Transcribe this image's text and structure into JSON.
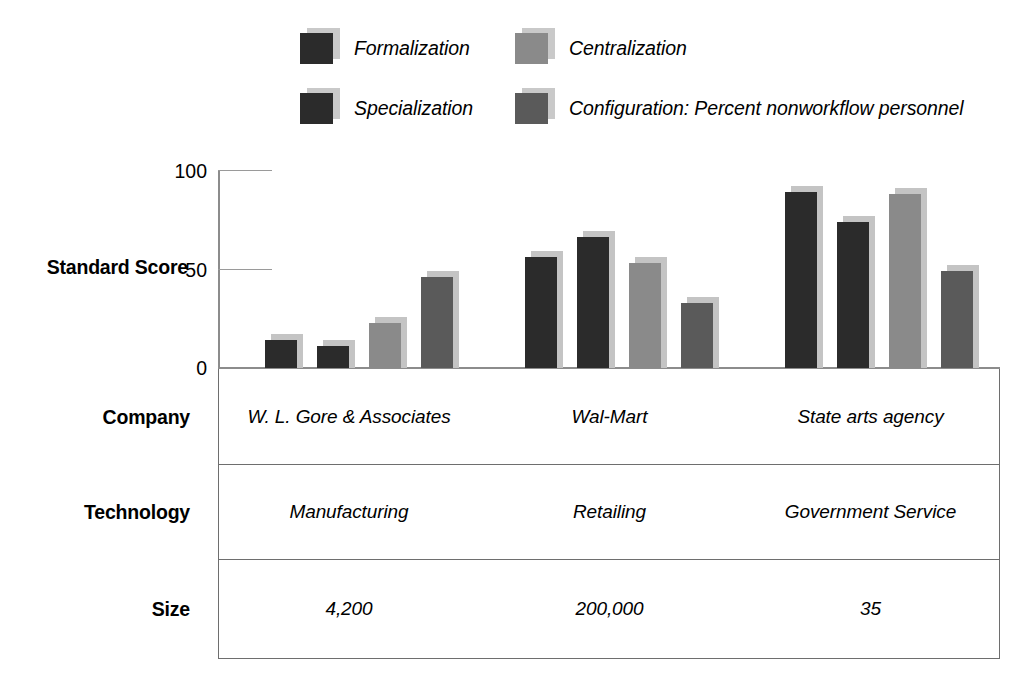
{
  "chart_data": {
    "type": "bar",
    "title": "",
    "xlabel": "",
    "ylabel": "Standard Score",
    "ylim": [
      0,
      100
    ],
    "yticks": [
      0,
      50,
      100
    ],
    "grid": false,
    "legend_position": "top",
    "categories": [
      "W. L. Gore & Associates",
      "Wal-Mart",
      "State arts agency"
    ],
    "series": [
      {
        "name": "Formalization",
        "color": "#2b2b2b",
        "values": [
          17,
          59,
          92
        ]
      },
      {
        "name": "Specialization",
        "color": "#2b2b2b",
        "values": [
          14,
          69,
          77
        ]
      },
      {
        "name": "Centralization",
        "color": "#8a8a8a",
        "values": [
          26,
          56,
          91
        ]
      },
      {
        "name": "Configuration: Percent nonworkflow personnel",
        "color": "#5a5a5a",
        "values": [
          49,
          36,
          52
        ]
      }
    ]
  },
  "legend": {
    "items": [
      {
        "label": "Formalization",
        "color": "#2b2b2b"
      },
      {
        "label": "Centralization",
        "color": "#8a8a8a"
      },
      {
        "label": "Specialization",
        "color": "#2b2b2b"
      },
      {
        "label": "Configuration: Percent nonworkflow personnel",
        "color": "#5a5a5a"
      }
    ]
  },
  "axis": {
    "label": "Standard Score",
    "tick_100": "100",
    "tick_50": "50",
    "tick_0": "0"
  },
  "table": {
    "row_labels": [
      "Company",
      "Technology",
      "Size"
    ],
    "rows": [
      [
        "W. L. Gore & Associates",
        "Wal-Mart",
        "State arts agency"
      ],
      [
        "Manufacturing",
        "Retailing",
        "Government Service"
      ],
      [
        "4,200",
        "200,000",
        "35"
      ]
    ]
  },
  "colors": {
    "dark": "#2b2b2b",
    "light_gray": "#8a8a8a",
    "mid_gray": "#5a5a5a",
    "shadow": "#c4c4c4",
    "rule": "#6e6e6e"
  }
}
